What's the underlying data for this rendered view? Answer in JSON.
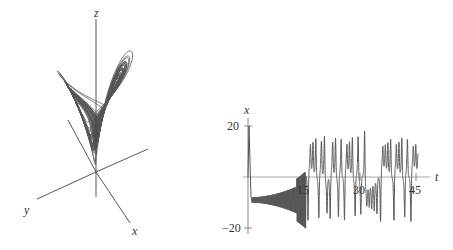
{
  "figure": {
    "left_panel": {
      "type": "3d-phase-portrait",
      "description": "Lorenz attractor",
      "axis_labels": {
        "x": "x",
        "y": "y",
        "z": "z"
      },
      "line_color": "#555555"
    },
    "right_panel": {
      "type": "time-series",
      "axis_labels": {
        "x": "t",
        "y": "x"
      },
      "x_ticks": [
        "15",
        "30",
        "45"
      ],
      "y_ticks": [
        "20",
        "−20"
      ],
      "line_color": "#555555",
      "axis_color": "#aaaaaa"
    }
  },
  "chart_data": {
    "type": "line",
    "title": "",
    "xlabel": "t",
    "ylabel": "x",
    "xlim": [
      0,
      48
    ],
    "ylim": [
      -22,
      22
    ],
    "x_ticks": [
      15,
      30,
      45
    ],
    "y_ticks": [
      -20,
      20
    ],
    "series": [
      {
        "name": "x(t)",
        "description": "Lorenz x-component: initial spike to ~20 near t=0, then oscillations around -8 with growing amplitude until t~15, then chaotic switching between about -18 and +16 up to t~45",
        "t": [
          0,
          0.3,
          0.6,
          1,
          5,
          10,
          14,
          15,
          16,
          17,
          18,
          19,
          20,
          21,
          22,
          24,
          26,
          28,
          30,
          32,
          34,
          36,
          38,
          40,
          42,
          44,
          45
        ],
        "x": [
          1,
          20,
          5,
          -8,
          -8,
          -8,
          -10,
          -14,
          15,
          -16,
          14,
          -17,
          15,
          12,
          -16,
          15,
          -16,
          15,
          -16,
          16,
          -15,
          15,
          -17,
          16,
          -17,
          15,
          12
        ]
      }
    ]
  }
}
